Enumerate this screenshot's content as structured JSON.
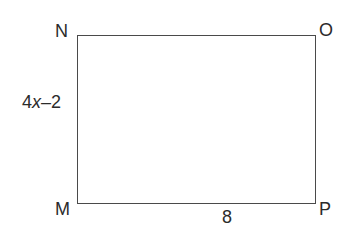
{
  "diagram": {
    "type": "rectangle",
    "vertices": {
      "top_left": "N",
      "top_right": "O",
      "bottom_left": "M",
      "bottom_right": "P"
    },
    "side_labels": {
      "left": {
        "coefficient": "4",
        "variable": "x",
        "rest": "–2",
        "full": "4x–2"
      },
      "bottom": "8"
    },
    "colors": {
      "stroke": "#4a4a4a",
      "text": "#2b2b2b",
      "background": "#ffffff"
    }
  }
}
